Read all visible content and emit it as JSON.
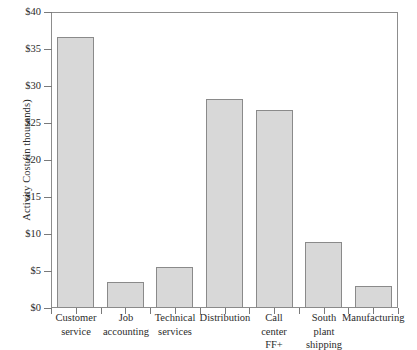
{
  "chart_data": {
    "type": "bar",
    "title": "",
    "xlabel": "",
    "ylabel": "Activity Cost (in thousands)",
    "ylim": [
      0,
      40
    ],
    "ytick_labels": [
      "$0",
      "$5",
      "$10",
      "$15",
      "$20",
      "$25",
      "$30",
      "$35",
      "$40"
    ],
    "ytick_values": [
      0,
      5,
      10,
      15,
      20,
      25,
      30,
      35,
      40
    ],
    "grid": false,
    "legend": "none",
    "categories": [
      "Customer\nservice",
      "Job\naccounting",
      "Technical\nservices",
      "Distribution",
      "Call\ncenter\nFF+",
      "South\nplant\nshipping",
      "Manufacturing"
    ],
    "values": [
      36.6,
      3.5,
      5.5,
      28.3,
      26.8,
      8.9,
      3.0
    ],
    "bar_color": "#d8d8d8",
    "bar_border_color": "#8a8a8a",
    "axis_color": "#8d8d8d",
    "background_color": "#ffffff"
  }
}
